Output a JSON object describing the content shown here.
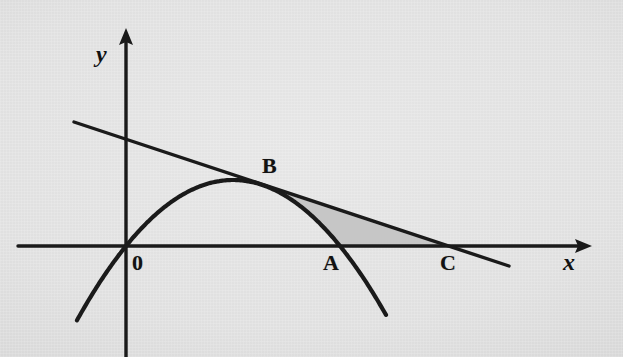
{
  "figure": {
    "kind": "coordinate-geometry-diagram",
    "background_color": "#e3e3e3",
    "ink_color": "#1a1a1a",
    "shaded_region_color": "#c6c6c6",
    "width": 623,
    "height": 357
  },
  "axes": {
    "x_label": "x",
    "y_label": "y",
    "origin_label": "0",
    "origin_px": [
      126,
      246
    ],
    "x_axis_from_px": [
      18,
      246
    ],
    "x_axis_to_px": [
      592,
      246
    ],
    "y_axis_from_px": [
      126,
      357
    ],
    "y_axis_to_px": [
      126,
      28
    ],
    "x_label_px": [
      563,
      250
    ],
    "y_label_px": [
      96,
      42
    ],
    "origin_label_px": [
      132,
      252
    ]
  },
  "chart_data": {
    "type": "line",
    "title": "",
    "xlabel": "x",
    "ylabel": "y",
    "grid": false,
    "legend": null,
    "series": [
      {
        "name": "parabola",
        "kind": "quadratic",
        "description": "downward-opening parabola through the origin",
        "vertex_px": [
          233,
          180
        ],
        "roots_px": [
          126,
          340
        ],
        "draw_domain_px": [
          77,
          386
        ],
        "passes_through": [
          "O",
          "A",
          "B"
        ]
      },
      {
        "name": "tangent-line",
        "kind": "linear",
        "description": "straight line tangent to the parabola at B, crossing the x-axis at C",
        "from_px": [
          74,
          122
        ],
        "to_px": [
          509,
          266
        ],
        "y_intercept_px": [
          126,
          139
        ],
        "x_intercept_px": [
          443,
          246
        ],
        "passes_through": [
          "B",
          "C"
        ]
      }
    ],
    "shaded_regions": [
      {
        "name": "region-ABC",
        "color": "#c6c6c6",
        "bounded_by": [
          "tangent-line BC",
          "parabola arc BA",
          "x-axis AC"
        ],
        "vertices": [
          "B",
          "A",
          "C"
        ]
      }
    ],
    "points": [
      {
        "id": "O",
        "label": "0",
        "px": [
          126,
          246
        ],
        "label_px": [
          132,
          252
        ],
        "note": "origin"
      },
      {
        "id": "A",
        "label": "A",
        "px": [
          338,
          246
        ],
        "label_px": [
          323,
          252
        ],
        "note": "parabola x-intercept"
      },
      {
        "id": "B",
        "label": "B",
        "px": [
          275,
          191
        ],
        "label_px": [
          262,
          155
        ],
        "note": "point of tangency"
      },
      {
        "id": "C",
        "label": "C",
        "px": [
          443,
          246
        ],
        "label_px": [
          440,
          252
        ],
        "note": "line x-intercept"
      }
    ]
  },
  "labels": {
    "point_o": "0",
    "point_a": "A",
    "point_b": "B",
    "point_c": "C",
    "axis_x": "x",
    "axis_y": "y"
  }
}
